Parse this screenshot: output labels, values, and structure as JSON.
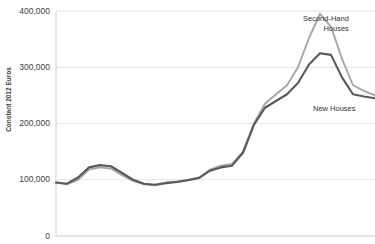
{
  "chart_data": {
    "type": "line",
    "title": "",
    "xlabel": "",
    "ylabel": "Constant 2012 Euros",
    "ylim": [
      0,
      400000
    ],
    "grid": true,
    "legend_position": "inline-right",
    "y_ticks": [
      "0",
      "100,000",
      "200,000",
      "300,000",
      "400,000"
    ],
    "y_tick_values": [
      0,
      100000,
      200000,
      300000,
      400000
    ],
    "x_ticks": [],
    "series": [
      {
        "name": "Second-Hand Houses",
        "color": "#a6a6a6",
        "values": [
          95000,
          92000,
          100000,
          118000,
          122000,
          120000,
          108000,
          98000,
          92000,
          90000,
          95000,
          97000,
          100000,
          104000,
          118000,
          125000,
          128000,
          150000,
          200000,
          235000,
          252000,
          268000,
          300000,
          352000,
          395000,
          372000,
          315000,
          268000,
          258000,
          250000
        ]
      },
      {
        "name": "New Houses",
        "color": "#595959",
        "values": [
          95000,
          93000,
          104000,
          122000,
          126000,
          124000,
          112000,
          100000,
          93000,
          91000,
          94000,
          96000,
          99000,
          103000,
          116000,
          122000,
          125000,
          148000,
          198000,
          228000,
          240000,
          252000,
          272000,
          305000,
          325000,
          322000,
          282000,
          252000,
          248000,
          245000
        ]
      }
    ]
  },
  "labels": {
    "second_hand_line1": "Second-Hand",
    "second_hand_line2": "Houses",
    "new_houses": "New Houses"
  },
  "clipped_header": {
    "text": ""
  }
}
